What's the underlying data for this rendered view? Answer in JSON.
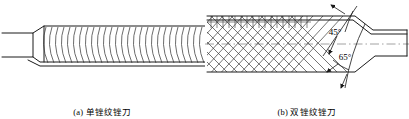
{
  "figure": {
    "background": "#ffffff",
    "line_color": "#1a1a1a",
    "hatch_color": "#3a3a3a",
    "centerline_color": "#8a8a8a"
  },
  "panels": [
    {
      "id": "a",
      "caption": "(a) 单锉纹锉刀",
      "subject": "single-cut file",
      "cut_pattern": "single-cut curved teeth",
      "tooth_count": 27,
      "orientation": "tang-left, body-right"
    },
    {
      "id": "b",
      "caption": "(b) 双锉纹锉刀",
      "subject": "double-cut file",
      "cut_pattern": "double-cut cross hatch",
      "orientation": "body-left, tang-right",
      "annotations": [
        {
          "name": "upcut-angle",
          "label": "45°",
          "value": 45,
          "unit": "deg"
        },
        {
          "name": "overcut-angle",
          "label": "65°",
          "value": 65,
          "unit": "deg"
        }
      ]
    }
  ]
}
